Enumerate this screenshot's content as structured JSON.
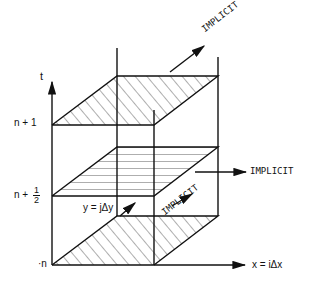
{
  "diagram": {
    "type": "three-level time stepping grid (ADI scheme)",
    "axes": {
      "t_label": "t",
      "x_label": "x = iΔx",
      "y_label": "y = jΔy"
    },
    "levels": [
      {
        "label_main": "n + 1",
        "hatch": "diagonal"
      },
      {
        "label_main": "n +",
        "frac_num": "1",
        "frac_den": "2",
        "hatch": "horizontal"
      },
      {
        "label_main": "·n",
        "hatch": "diagonal"
      }
    ],
    "annotations": {
      "top_implicit": "IMPLICIT",
      "right_implicit": "IMPLICIT",
      "diagonal_implicit": "IMPLICIT"
    },
    "colors": {
      "ink": "#111111",
      "background": "#ffffff"
    }
  }
}
